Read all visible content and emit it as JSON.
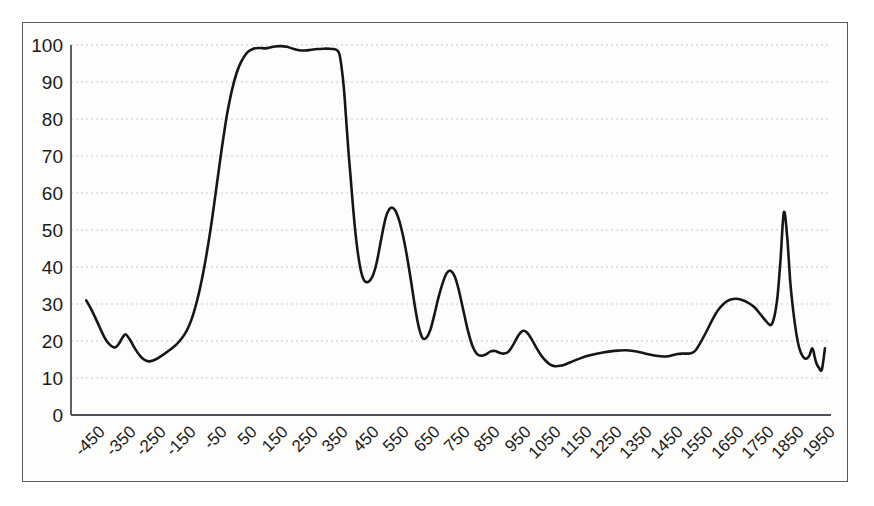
{
  "chart_data": {
    "type": "line",
    "title": "",
    "subtitle": "",
    "xlabel": "",
    "ylabel": "",
    "xlim": [
      -500,
      2000
    ],
    "ylim": [
      0,
      100
    ],
    "grid": true,
    "legend": null,
    "legend_position": "none",
    "line_color": "#161616",
    "grid_color": "#c9c9c9",
    "axis_color": "#4b5054",
    "background_color": "#fdfdfc",
    "x_ticks": [
      -450,
      -350,
      -250,
      -150,
      -50,
      50,
      150,
      250,
      350,
      450,
      550,
      650,
      750,
      850,
      950,
      1050,
      1150,
      1250,
      1350,
      1450,
      1550,
      1650,
      1750,
      1850,
      1950
    ],
    "x_tick_labels": [
      "-450",
      "-350",
      "-250",
      "-150",
      "-50",
      "50",
      "150",
      "250",
      "350",
      "450",
      "550",
      "650",
      "750",
      "850",
      "950",
      "1050",
      "1150",
      "1250",
      "1350",
      "1450",
      "1550",
      "1650",
      "1750",
      "1850",
      "1950"
    ],
    "y_ticks": [
      0,
      10,
      20,
      30,
      40,
      50,
      60,
      70,
      80,
      90,
      100
    ],
    "y_tick_labels": [
      "0",
      "10",
      "20",
      "30",
      "40",
      "50",
      "60",
      "70",
      "80",
      "90",
      "100"
    ],
    "x": [
      -450,
      -430,
      -410,
      -390,
      -375,
      -360,
      -350,
      -340,
      -330,
      -320,
      -305,
      -290,
      -275,
      -260,
      -245,
      -230,
      -215,
      -200,
      -185,
      -170,
      -155,
      -145,
      -135,
      -125,
      -115,
      -105,
      -95,
      -85,
      -75,
      -65,
      -55,
      -45,
      -35,
      -25,
      -15,
      -5,
      5,
      15,
      30,
      45,
      60,
      80,
      100,
      120,
      140,
      155,
      170,
      190,
      210,
      230,
      250,
      270,
      290,
      310,
      330,
      350,
      365,
      375,
      383,
      390,
      398,
      405,
      412,
      420,
      428,
      436,
      445,
      455,
      465,
      478,
      492,
      505,
      518,
      530,
      540,
      552,
      565,
      578,
      592,
      605,
      618,
      630,
      642,
      655,
      668,
      682,
      695,
      708,
      722,
      735,
      748,
      762,
      775,
      790,
      805,
      820,
      835,
      850,
      865,
      880,
      895,
      910,
      925,
      940,
      955,
      970,
      985,
      1000,
      1015,
      1030,
      1045,
      1060,
      1075,
      1090,
      1110,
      1130,
      1150,
      1175,
      1200,
      1225,
      1250,
      1275,
      1300,
      1325,
      1350,
      1375,
      1400,
      1425,
      1450,
      1465,
      1480,
      1495,
      1510,
      1525,
      1540,
      1555,
      1570,
      1590,
      1610,
      1630,
      1650,
      1670,
      1690,
      1710,
      1730,
      1750,
      1765,
      1778,
      1788,
      1795,
      1800,
      1805,
      1810,
      1816,
      1824,
      1834,
      1845,
      1856,
      1866,
      1876,
      1886,
      1896,
      1906,
      1916,
      1924,
      1930,
      1934,
      1938,
      1942,
      1946,
      1952,
      1960,
      1970,
      1980
    ],
    "y": [
      31.0,
      28.0,
      24.5,
      21.0,
      19.2,
      18.3,
      18.5,
      19.6,
      21.0,
      21.8,
      20.2,
      18.0,
      16.2,
      15.0,
      14.5,
      14.7,
      15.3,
      16.1,
      17.0,
      17.9,
      18.9,
      19.8,
      20.8,
      22.0,
      23.5,
      25.5,
      28.0,
      31.0,
      34.5,
      38.5,
      43.0,
      48.0,
      53.5,
      59.5,
      65.5,
      71.5,
      77.0,
      82.0,
      88.0,
      92.5,
      95.5,
      98.0,
      99.0,
      99.2,
      99.1,
      99.3,
      99.6,
      99.7,
      99.5,
      99.0,
      98.6,
      98.5,
      98.7,
      98.9,
      99.0,
      99.0,
      98.9,
      98.6,
      97.5,
      94.0,
      88.0,
      80.0,
      72.0,
      64.0,
      56.0,
      49.0,
      43.0,
      38.5,
      36.3,
      36.0,
      37.5,
      41.0,
      46.5,
      51.5,
      54.5,
      56.0,
      55.5,
      53.0,
      48.5,
      43.0,
      36.5,
      30.0,
      24.5,
      21.0,
      20.8,
      23.0,
      27.0,
      31.5,
      35.5,
      38.2,
      39.0,
      37.5,
      34.0,
      28.5,
      23.0,
      18.8,
      16.5,
      16.0,
      16.4,
      17.2,
      17.3,
      16.8,
      16.6,
      17.2,
      19.0,
      21.3,
      22.7,
      22.3,
      20.5,
      18.3,
      16.3,
      14.8,
      13.7,
      13.2,
      13.3,
      13.8,
      14.5,
      15.3,
      16.0,
      16.5,
      16.9,
      17.2,
      17.4,
      17.5,
      17.3,
      16.9,
      16.4,
      16.0,
      15.8,
      15.9,
      16.2,
      16.5,
      16.6,
      16.6,
      16.7,
      17.5,
      19.5,
      22.5,
      25.8,
      28.5,
      30.3,
      31.2,
      31.4,
      31.0,
      30.2,
      29.0,
      27.5,
      26.2,
      25.2,
      24.6,
      24.3,
      24.5,
      25.5,
      27.5,
      32.0,
      42.0,
      54.8,
      48.0,
      36.0,
      28.0,
      22.0,
      18.0,
      16.0,
      15.2,
      15.5,
      16.3,
      17.3,
      18.0,
      17.4,
      15.8,
      14.0,
      12.8,
      12.3,
      18.0,
      30.0,
      40.5,
      30.0,
      17.0,
      13.5,
      12.5,
      12.0,
      11.8
    ]
  }
}
